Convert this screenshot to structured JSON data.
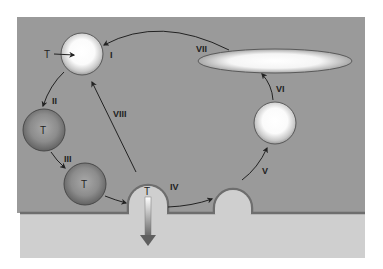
{
  "diagram": {
    "type": "cycle",
    "colors": {
      "page_background": "#ffffff",
      "upper_compartment": "#9a9a9a",
      "lower_compartment": "#cfcfcf",
      "membrane": "#6e6e6e",
      "arrow": "#222222",
      "dark_sphere": "#8a8a8a",
      "light_sphere": "#ffffff",
      "down_arrow_top": "#ffffff",
      "down_arrow_bottom": "#6a6a6a"
    },
    "stages": [
      {
        "id": "I",
        "label": "I",
        "object": "light-sphere",
        "content": "T"
      },
      {
        "id": "II",
        "label": "II",
        "object": "dark-sphere",
        "content": "T"
      },
      {
        "id": "III",
        "label": "III",
        "object": "dark-sphere",
        "content": "T"
      },
      {
        "id": "IV",
        "label": "IV",
        "object": "membrane-bud",
        "content": "T"
      },
      {
        "id": "V",
        "label": "V",
        "object": "membrane-bud",
        "content": ""
      },
      {
        "id": "VI",
        "label": "VI",
        "object": "light-sphere",
        "content": ""
      },
      {
        "id": "VII",
        "label": "VII",
        "object": "flat-ellipse",
        "content": ""
      },
      {
        "id": "VIII",
        "label": "VIII",
        "object": "arrow",
        "content": ""
      }
    ],
    "labels": {
      "t_entry": "T",
      "t_sphere_2": "T",
      "t_sphere_3": "T",
      "t_bud": "T",
      "roman_1": "I",
      "roman_2": "II",
      "roman_3": "III",
      "roman_4": "IV",
      "roman_5": "V",
      "roman_6": "VI",
      "roman_7": "VII",
      "roman_8": "VIII"
    }
  }
}
